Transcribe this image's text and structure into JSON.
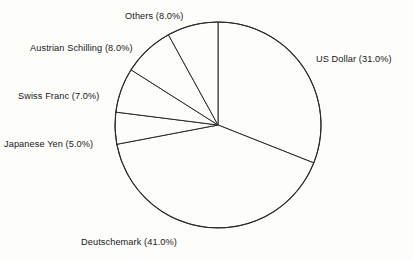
{
  "chart_data": {
    "type": "pie",
    "title": "",
    "subtitle": "",
    "xlabel": "",
    "ylabel": "",
    "grid": false,
    "legend_position": "outside-labels",
    "start_angle_deg": 90,
    "direction": "clockwise",
    "categories": [
      "US Dollar",
      "Deutschemark",
      "Japanese Yen",
      "Swiss Franc",
      "Austrian Schilling",
      "Others"
    ],
    "values": [
      31.0,
      41.0,
      5.0,
      7.0,
      8.0,
      8.0
    ],
    "unit": "%",
    "labels": [
      "US Dollar (31.0%)",
      "Deutschemark (41.0%)",
      "Japanese Yen (5.0%)",
      "Swiss Franc (7.0%)",
      "Austrian Schilling (8.0%)",
      "Others (8.0%)"
    ],
    "slices": [
      {
        "name": "US Dollar",
        "value": 31.0,
        "label": "US Dollar (31.0%)",
        "color": "#fdfdfa"
      },
      {
        "name": "Deutschemark",
        "value": 41.0,
        "label": "Deutschemark (41.0%)",
        "color": "#fdfdfa"
      },
      {
        "name": "Japanese Yen",
        "value": 5.0,
        "label": "Japanese Yen (5.0%)",
        "color": "#fdfdfa"
      },
      {
        "name": "Swiss Franc",
        "value": 7.0,
        "label": "Swiss Franc (7.0%)",
        "color": "#fdfdfa"
      },
      {
        "name": "Austrian Schilling",
        "value": 8.0,
        "label": "Austrian Schilling (8.0%)",
        "color": "#fdfdfa"
      },
      {
        "name": "Others",
        "value": 8.0,
        "label": "Others (8.0%)",
        "color": "#fdfdfa"
      }
    ]
  },
  "style": {
    "background": "#fdfdfa",
    "stroke": "#2b2b2b",
    "text": "#17171a"
  },
  "geometry": {
    "cx": 218,
    "cy": 125,
    "r": 103
  }
}
